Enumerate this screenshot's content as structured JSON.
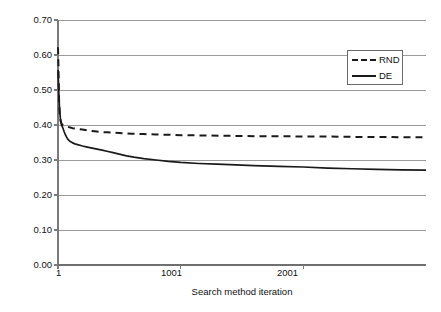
{
  "chart_data": {
    "type": "line",
    "title": "",
    "xlabel": "Search method iteration",
    "ylabel": "Solution quality - lower is better",
    "xlim": [
      1,
      3001
    ],
    "ylim": [
      0.0,
      0.7
    ],
    "xticks": [
      1,
      1001,
      2001
    ],
    "xtick_labels": [
      "1",
      "1001",
      "2001"
    ],
    "yticks": [
      0.0,
      0.1,
      0.2,
      0.3,
      0.4,
      0.5,
      0.6,
      0.7
    ],
    "ytick_labels": [
      "0.00",
      "0.10",
      "0.20",
      "0.30",
      "0.40",
      "0.50",
      "0.60",
      "0.70"
    ],
    "grid": "horizontal",
    "legend_position": "upper-right",
    "legend": [
      "RND",
      "DE"
    ],
    "colors": {
      "rnd_line": "#1a1a1a",
      "de_line": "#1a1a1a",
      "gridline": "#9a9a9a",
      "axis": "#7a7a7a",
      "background": "#ffffff"
    },
    "series": [
      {
        "name": "RND",
        "style": "dashed",
        "x": [
          1,
          5,
          10,
          15,
          20,
          25,
          30,
          40,
          50,
          60,
          70,
          80,
          90,
          100,
          120,
          140,
          160,
          180,
          200,
          250,
          300,
          350,
          400,
          450,
          500,
          600,
          700,
          800,
          900,
          1001,
          1200,
          1400,
          1600,
          1800,
          2001,
          2200,
          2400,
          2600,
          2800,
          3001
        ],
        "y": [
          0.622,
          0.56,
          0.47,
          0.43,
          0.415,
          0.408,
          0.404,
          0.4,
          0.398,
          0.397,
          0.396,
          0.395,
          0.394,
          0.393,
          0.391,
          0.39,
          0.389,
          0.388,
          0.387,
          0.384,
          0.382,
          0.38,
          0.379,
          0.378,
          0.377,
          0.375,
          0.374,
          0.373,
          0.372,
          0.371,
          0.37,
          0.369,
          0.368,
          0.368,
          0.367,
          0.367,
          0.366,
          0.366,
          0.365,
          0.365
        ]
      },
      {
        "name": "DE",
        "style": "solid",
        "x": [
          1,
          5,
          10,
          15,
          20,
          25,
          30,
          35,
          40,
          50,
          60,
          70,
          80,
          90,
          100,
          120,
          140,
          160,
          180,
          200,
          240,
          280,
          320,
          360,
          400,
          450,
          500,
          560,
          620,
          700,
          800,
          900,
          1001,
          1150,
          1300,
          1450,
          1600,
          1800,
          2001,
          2200,
          2400,
          2600,
          2800,
          3001
        ],
        "y": [
          0.558,
          0.52,
          0.47,
          0.44,
          0.42,
          0.408,
          0.4,
          0.396,
          0.392,
          0.382,
          0.373,
          0.366,
          0.36,
          0.356,
          0.353,
          0.349,
          0.346,
          0.344,
          0.342,
          0.34,
          0.337,
          0.334,
          0.331,
          0.328,
          0.325,
          0.321,
          0.317,
          0.312,
          0.308,
          0.304,
          0.3,
          0.296,
          0.293,
          0.29,
          0.288,
          0.286,
          0.284,
          0.282,
          0.28,
          0.277,
          0.275,
          0.273,
          0.272,
          0.271
        ]
      }
    ]
  }
}
